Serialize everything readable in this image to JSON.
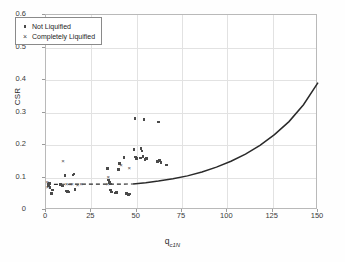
{
  "chart_data": {
    "type": "scatter",
    "title": "",
    "xlabel": "q",
    "xlabel_sub": "c1N",
    "ylabel": "CSR",
    "xlim": [
      0,
      150
    ],
    "ylim": [
      0,
      0.6
    ],
    "xticks": [
      "0",
      "25",
      "50",
      "75",
      "100",
      "125",
      "150"
    ],
    "yticks": [
      "0",
      "0.1",
      "0.2",
      "0.3",
      "0.4",
      "0.5",
      "0.6"
    ],
    "grid": true,
    "legend_position": "upper-left",
    "legend": [
      {
        "label": "Not Liquified",
        "marker": "square"
      },
      {
        "label": "Completely Liquified",
        "marker": "cross"
      }
    ],
    "series": [
      {
        "name": "Not Liquified",
        "marker": "square",
        "color": "#4a4a4a",
        "points": [
          [
            1.2,
            0.079
          ],
          [
            1.5,
            0.075
          ],
          [
            2.0,
            0.082
          ],
          [
            2.2,
            0.07
          ],
          [
            3.0,
            0.05
          ],
          [
            3.5,
            0.062
          ],
          [
            8.0,
            0.078
          ],
          [
            9.0,
            0.074
          ],
          [
            10.5,
            0.106
          ],
          [
            11.0,
            0.058
          ],
          [
            12.0,
            0.057
          ],
          [
            12.5,
            0.055
          ],
          [
            15.0,
            0.108
          ],
          [
            15.5,
            0.111
          ],
          [
            16.0,
            0.063
          ],
          [
            34.0,
            0.128
          ],
          [
            34.5,
            0.092
          ],
          [
            35.0,
            0.084
          ],
          [
            35.5,
            0.08
          ],
          [
            35.5,
            0.062
          ],
          [
            36.0,
            0.055
          ],
          [
            38.0,
            0.052
          ],
          [
            39.0,
            0.053
          ],
          [
            40.0,
            0.124
          ],
          [
            40.5,
            0.143
          ],
          [
            43.0,
            0.161
          ],
          [
            44.5,
            0.05
          ],
          [
            45.5,
            0.047
          ],
          [
            46.0,
            0.049
          ],
          [
            48.5,
            0.186
          ],
          [
            49.0,
            0.281
          ],
          [
            49.5,
            0.163
          ],
          [
            50.0,
            0.158
          ],
          [
            52.0,
            0.16
          ],
          [
            52.5,
            0.19
          ],
          [
            53.0,
            0.182
          ],
          [
            53.5,
            0.165
          ],
          [
            54.0,
            0.279
          ],
          [
            54.5,
            0.155
          ],
          [
            55.5,
            0.158
          ],
          [
            61.5,
            0.15
          ],
          [
            62.0,
            0.271
          ],
          [
            62.5,
            0.152
          ],
          [
            63.5,
            0.146
          ],
          [
            66.5,
            0.139
          ]
        ]
      },
      {
        "name": "Completely Liquified",
        "marker": "cross",
        "color": "#4a4a4a",
        "points": [
          [
            0.8,
            0.085
          ],
          [
            1.0,
            0.072
          ],
          [
            9.5,
            0.152
          ],
          [
            11.5,
            0.079
          ],
          [
            13.5,
            0.079
          ],
          [
            14.5,
            0.079
          ],
          [
            17.5,
            0.078
          ],
          [
            19.5,
            0.079
          ],
          [
            34.0,
            0.079
          ],
          [
            34.5,
            0.103
          ],
          [
            41.5,
            0.137
          ],
          [
            46.0,
            0.13
          ]
        ]
      }
    ],
    "curves": [
      {
        "name": "liquefaction-triggering-curve",
        "style": "solid",
        "color": "#2a2a2a",
        "points": [
          [
            48,
            0.08
          ],
          [
            55,
            0.084
          ],
          [
            62,
            0.089
          ],
          [
            70,
            0.096
          ],
          [
            78,
            0.105
          ],
          [
            86,
            0.117
          ],
          [
            94,
            0.132
          ],
          [
            102,
            0.15
          ],
          [
            110,
            0.172
          ],
          [
            118,
            0.199
          ],
          [
            126,
            0.232
          ],
          [
            134,
            0.272
          ],
          [
            142,
            0.324
          ],
          [
            150,
            0.392
          ]
        ]
      },
      {
        "name": "dashed-extension",
        "style": "dashed",
        "color": "#2a2a2a",
        "points": [
          [
            0.5,
            0.079
          ],
          [
            48,
            0.08
          ]
        ]
      }
    ]
  }
}
